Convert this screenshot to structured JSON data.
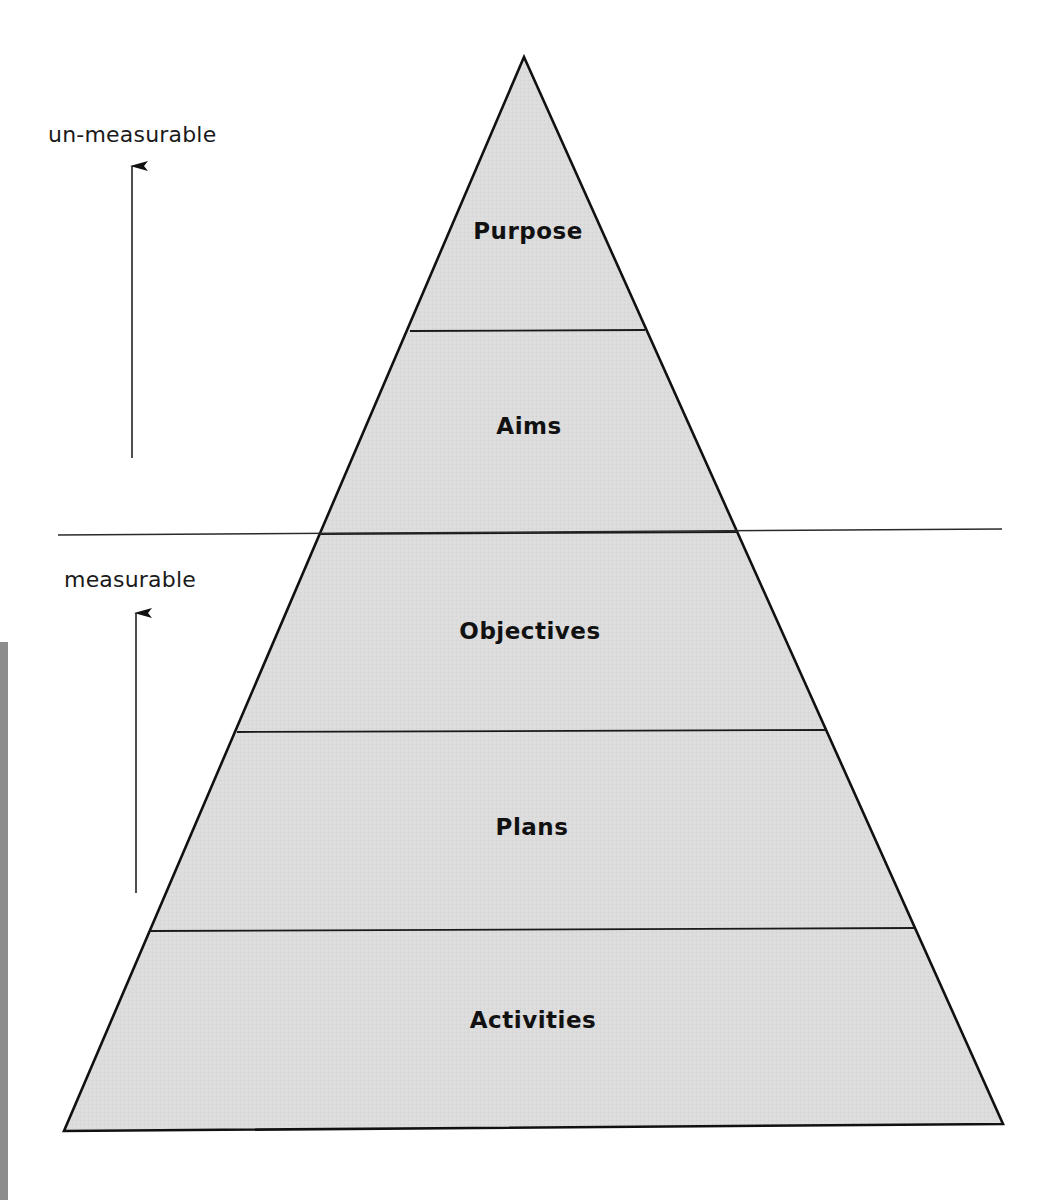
{
  "diagram": {
    "type": "pyramid",
    "colors": {
      "fill": "#dcdcdc",
      "stroke": "#111111",
      "text": "#111111",
      "edge_bar": "#8c8c8c",
      "background": "#ffffff"
    },
    "layers": [
      {
        "label": "Purpose"
      },
      {
        "label": "Aims"
      },
      {
        "label": "Objectives"
      },
      {
        "label": "Plans"
      },
      {
        "label": "Activities"
      }
    ],
    "side_labels": {
      "upper": "un-measurable",
      "lower": "measurable"
    },
    "divider": {
      "between": [
        "Aims",
        "Objectives"
      ],
      "meaning": "boundary between un-measurable and measurable"
    }
  }
}
